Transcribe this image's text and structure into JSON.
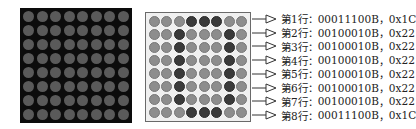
{
  "dark_matrix": {
    "rows": 8,
    "cols": 8,
    "led_color": "#5a5a5a",
    "background": "#0c0c0c"
  },
  "light_matrix": {
    "rows": 8,
    "cols": 8,
    "on_color": "#3a3a3a",
    "off_color": "#8d8d8d",
    "pattern": [
      "00011100",
      "00100010",
      "00100010",
      "00100010",
      "00100010",
      "00100010",
      "00100010",
      "00011100"
    ]
  },
  "labels": [
    {
      "row": "第1行",
      "sep": "：",
      "binary": "00011100B",
      "comma": "，",
      "hex": "0x1C"
    },
    {
      "row": "第2行",
      "sep": "：",
      "binary": "00100010B",
      "comma": "，",
      "hex": "0x22"
    },
    {
      "row": "第3行",
      "sep": "：",
      "binary": "00100010B",
      "comma": "，",
      "hex": "0x22"
    },
    {
      "row": "第4行",
      "sep": "：",
      "binary": "00100010B",
      "comma": "，",
      "hex": "0x22"
    },
    {
      "row": "第5行",
      "sep": "：",
      "binary": "00100010B",
      "comma": "，",
      "hex": "0x22"
    },
    {
      "row": "第6行",
      "sep": "：",
      "binary": "00100010B",
      "comma": "，",
      "hex": "0x22"
    },
    {
      "row": "第7行",
      "sep": "：",
      "binary": "00100010B",
      "comma": "，",
      "hex": "0x22"
    },
    {
      "row": "第8行",
      "sep": "：",
      "binary": "00011100B",
      "comma": "，",
      "hex": "0x1C"
    }
  ],
  "icons": {
    "arrow": "open-triangle-arrow-icon"
  }
}
